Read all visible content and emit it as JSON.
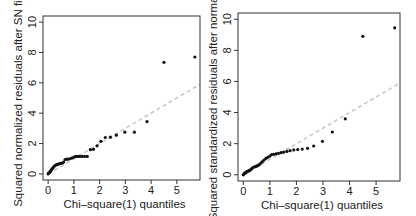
{
  "chart_data": [
    {
      "type": "scatter",
      "title": "",
      "xlabel": "Chi–square(1) quantiles",
      "ylabel": "Squared normalized residuals after SN fit",
      "xlim": [
        -0.2,
        5.9
      ],
      "ylim": [
        -0.4,
        10.4
      ],
      "xticks": [
        0,
        1,
        2,
        3,
        4,
        5
      ],
      "yticks": [
        0,
        2,
        4,
        6,
        8,
        10
      ],
      "grid": false,
      "legend": null,
      "reference_line": {
        "style": "dashed",
        "color": "#c8c8c8",
        "slope": 1,
        "intercept": 0
      },
      "points": {
        "x": [
          0.0,
          0.02,
          0.05,
          0.08,
          0.1,
          0.13,
          0.16,
          0.2,
          0.23,
          0.27,
          0.31,
          0.35,
          0.4,
          0.45,
          0.5,
          0.55,
          0.6,
          0.66,
          0.72,
          0.78,
          0.85,
          0.92,
          1.0,
          1.07,
          1.15,
          1.23,
          1.32,
          1.42,
          1.52,
          1.64,
          1.76,
          1.9,
          2.05,
          2.22,
          2.42,
          2.65,
          2.98,
          3.35,
          3.84,
          4.5,
          5.7
        ],
        "y": [
          0.0,
          0.05,
          0.1,
          0.15,
          0.2,
          0.28,
          0.35,
          0.42,
          0.5,
          0.55,
          0.6,
          0.62,
          0.65,
          0.68,
          0.7,
          0.72,
          0.78,
          0.95,
          0.97,
          0.98,
          1.0,
          1.05,
          1.1,
          1.15,
          1.15,
          1.15,
          1.15,
          1.15,
          1.15,
          1.6,
          1.62,
          1.85,
          2.15,
          2.4,
          2.42,
          2.55,
          2.75,
          2.75,
          3.45,
          7.35,
          7.7
        ]
      }
    },
    {
      "type": "scatter",
      "title": "",
      "xlabel": "Chi–square(1) quantiles",
      "ylabel": "Squared standardized residuals after normal fit",
      "xlim": [
        -0.2,
        5.9
      ],
      "ylim": [
        -0.4,
        10.4
      ],
      "xticks": [
        0,
        1,
        2,
        3,
        4,
        5
      ],
      "yticks": [
        0,
        2,
        4,
        6,
        8,
        10
      ],
      "grid": false,
      "legend": null,
      "reference_line": {
        "style": "dashed",
        "color": "#c8c8c8",
        "slope": 1,
        "intercept": 0
      },
      "points": {
        "x": [
          0.0,
          0.02,
          0.05,
          0.08,
          0.1,
          0.13,
          0.16,
          0.2,
          0.23,
          0.27,
          0.31,
          0.35,
          0.4,
          0.45,
          0.5,
          0.55,
          0.6,
          0.66,
          0.72,
          0.78,
          0.85,
          0.92,
          1.0,
          1.07,
          1.15,
          1.23,
          1.32,
          1.42,
          1.52,
          1.64,
          1.76,
          1.9,
          2.05,
          2.22,
          2.42,
          2.65,
          2.98,
          3.35,
          3.84,
          4.5,
          5.7
        ],
        "y": [
          0.0,
          0.05,
          0.1,
          0.12,
          0.15,
          0.2,
          0.22,
          0.25,
          0.28,
          0.32,
          0.38,
          0.45,
          0.5,
          0.52,
          0.55,
          0.6,
          0.65,
          0.75,
          0.85,
          0.95,
          1.05,
          1.12,
          1.2,
          1.3,
          1.32,
          1.35,
          1.38,
          1.42,
          1.45,
          1.5,
          1.55,
          1.6,
          1.62,
          1.65,
          1.7,
          1.85,
          2.15,
          2.75,
          3.6,
          8.9,
          9.45
        ]
      }
    }
  ]
}
